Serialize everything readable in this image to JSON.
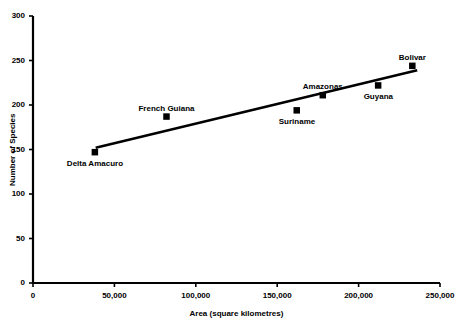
{
  "chart_data": {
    "type": "scatter",
    "title": "",
    "xlabel": "Area (square kilometres)",
    "ylabel": "Number of Species",
    "xlim": [
      0,
      250000
    ],
    "ylim": [
      0,
      300
    ],
    "grid": false,
    "legend": "none",
    "xticks": [
      "0",
      "50,000",
      "100,000",
      "150,000",
      "200,000",
      "250,000"
    ],
    "xtick_values": [
      0,
      50000,
      100000,
      150000,
      200000,
      250000
    ],
    "yticks": [
      "0",
      "50",
      "100",
      "150",
      "200",
      "250",
      "300"
    ],
    "ytick_values": [
      0,
      50,
      100,
      150,
      200,
      250,
      300
    ],
    "marker": "filled-square",
    "marker_color": "#000000",
    "line_color": "#000000",
    "points": [
      {
        "label": "Delta Amacuro",
        "x": 38000,
        "y": 147,
        "label_dx": -28,
        "label_dy": 12
      },
      {
        "label": "French Guiana",
        "x": 82000,
        "y": 187,
        "label_dx": -30,
        "label_dy": -13
      },
      {
        "label": "Suriname",
        "x": 162000,
        "y": 194,
        "label_dx": -20,
        "label_dy": 14
      },
      {
        "label": "Amazonas",
        "x": 178000,
        "y": 211,
        "label_dx": -23,
        "label_dy": -13
      },
      {
        "label": "Guyana",
        "x": 212000,
        "y": 222,
        "label_dx": -16,
        "label_dy": 14
      },
      {
        "label": "Bolivar",
        "x": 233000,
        "y": 244,
        "label_dx": -13,
        "label_dy": -13
      }
    ],
    "trendline": {
      "type": "linear",
      "x_start": 38500,
      "y_start": 152,
      "x_end": 236000,
      "y_end": 239
    }
  }
}
